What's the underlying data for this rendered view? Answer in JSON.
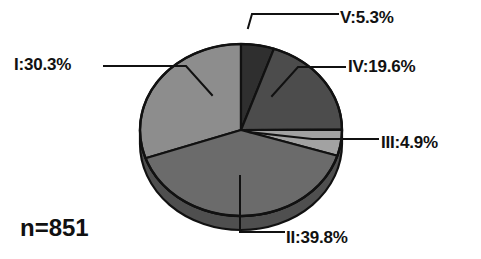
{
  "chart_data": {
    "type": "pie",
    "title": "",
    "subtitle": "",
    "xlabel": "",
    "ylabel": "",
    "legend_position": "none",
    "grid": false,
    "annotation": "n=851",
    "sample_size": 851,
    "unit": "%",
    "label_format": "{name}:{value}%",
    "start_angle_deg": 0,
    "direction": "clockwise",
    "categories": [
      "V",
      "IV",
      "III",
      "II",
      "I"
    ],
    "values": [
      5.3,
      19.6,
      4.9,
      39.8,
      30.3
    ],
    "slices": [
      {
        "name": "V",
        "label": "V:5.3%",
        "value": 5.3,
        "color": "#2f2f2f"
      },
      {
        "name": "IV",
        "label": "IV:19.6%",
        "value": 19.6,
        "color": "#4c4c4c"
      },
      {
        "name": "III",
        "label": "III:4.9%",
        "value": 4.9,
        "color": "#a2a2a2"
      },
      {
        "name": "II",
        "label": "II:39.8%",
        "value": 39.8,
        "color": "#6b6b6b"
      },
      {
        "name": "I",
        "label": "I:30.3%",
        "value": 30.3,
        "color": "#8d8d8d"
      }
    ]
  },
  "labels": {
    "slice_I": "I:30.3%",
    "slice_II": "II:39.8%",
    "slice_III": "III:4.9%",
    "slice_IV": "IV:19.6%",
    "slice_V": "V:5.3%",
    "sample_size": "n=851"
  },
  "colors": {
    "background": "#ffffff",
    "outline": "#111111",
    "text": "#111111",
    "slice_I": "#8d8d8d",
    "slice_II": "#6b6b6b",
    "slice_III": "#a2a2a2",
    "slice_IV": "#4c4c4c",
    "slice_V": "#2f2f2f",
    "side_I": "#6e6e6e",
    "side_II": "#505050",
    "side_III": "#828282"
  }
}
